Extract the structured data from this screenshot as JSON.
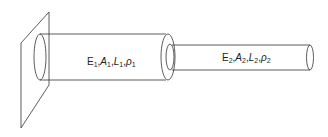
{
  "diagram": {
    "wall": {
      "label": ""
    },
    "segments": [
      {
        "id": 1,
        "E": "E",
        "A": "A",
        "L": "L",
        "rho": "ρ",
        "sub": "1"
      },
      {
        "id": 2,
        "E": "E",
        "A": "A",
        "L": "L",
        "rho": "ρ",
        "sub": "2"
      }
    ],
    "stroke_color": "#333333"
  }
}
